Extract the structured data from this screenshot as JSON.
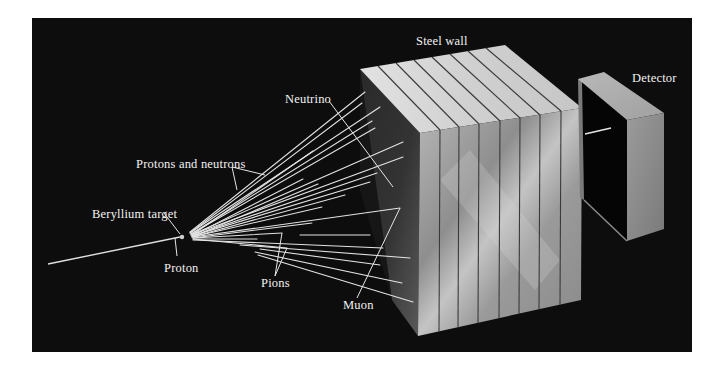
{
  "diagram": {
    "colors": {
      "page_background": "#ffffff",
      "panel_background": "#0d0d0d",
      "beam_lines": "#e6e6e6",
      "label_text": "#f2f2f2",
      "steel_top": "#d9d9d9",
      "steel_front": "#a6a6a6",
      "steel_side": "#4a4a4a",
      "detector_front": "#8f8f8f",
      "detector_top": "#b5b5b5"
    },
    "labels": {
      "steel_wall": "Steel wall",
      "detector": "Detector",
      "neutrino": "Neutrino",
      "protons_and_neutrons": "Protons and neutrons",
      "beryllium_target": "Beryllium target",
      "proton": "Proton",
      "pions": "Pions",
      "muon": "Muon"
    },
    "components": [
      {
        "id": "proton-beam",
        "kind": "incoming beam",
        "label": "Proton"
      },
      {
        "id": "beryllium-target",
        "kind": "target",
        "label": "Beryllium target"
      },
      {
        "id": "particle-spray",
        "kind": "secondary particles",
        "labels": [
          "Protons and neutrons",
          "Pions",
          "Muon",
          "Neutrino"
        ]
      },
      {
        "id": "steel-wall",
        "kind": "shield",
        "label": "Steel wall",
        "slab_count": 8
      },
      {
        "id": "detector",
        "kind": "detector",
        "label": "Detector"
      }
    ]
  }
}
